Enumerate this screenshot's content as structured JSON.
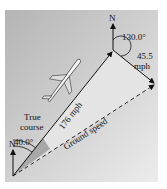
{
  "diagram": {
    "type": "vector-triangle",
    "labels": {
      "north_top": "N",
      "north_bottom": "N",
      "wind_angle": "130.0°",
      "wind_speed_line1": "45.5",
      "wind_speed_line2": "mph",
      "airspeed": "176 mph",
      "true_course_line1": "True",
      "true_course_line2": "course",
      "heading_angle": "40.0°",
      "ground_speed": "Ground speed"
    },
    "colors": {
      "panel_dark": "#b4b4b4",
      "panel_light": "#ececec",
      "triangle_fill": "#e2e2e2",
      "wedge_fill": "#a8a8a8",
      "line": "#111111"
    }
  }
}
